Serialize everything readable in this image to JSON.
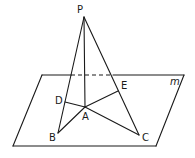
{
  "diagram": {
    "type": "3d-geometry",
    "plane": {
      "label": "m",
      "corners": {
        "top_left": [
          42,
          75
        ],
        "top_right": [
          184,
          75
        ],
        "bottom_right": [
          156,
          146
        ],
        "bottom_left": [
          13,
          146
        ]
      }
    },
    "points": {
      "P": {
        "label": "P",
        "xy": [
          84,
          17
        ]
      },
      "A": {
        "label": "A",
        "xy": [
          85,
          107
        ]
      },
      "B": {
        "label": "B",
        "xy": [
          58,
          133
        ]
      },
      "C": {
        "label": "C",
        "xy": [
          139,
          135
        ]
      },
      "D": {
        "label": "D",
        "xy": [
          65,
          102
        ]
      },
      "E": {
        "label": "E",
        "xy": [
          118,
          91
        ]
      }
    },
    "segments": [
      "PA",
      "PB",
      "PC",
      "AB",
      "AC",
      "AD",
      "AE"
    ],
    "hidden_segment": "plane top edge between PB and PC (dashed)"
  }
}
